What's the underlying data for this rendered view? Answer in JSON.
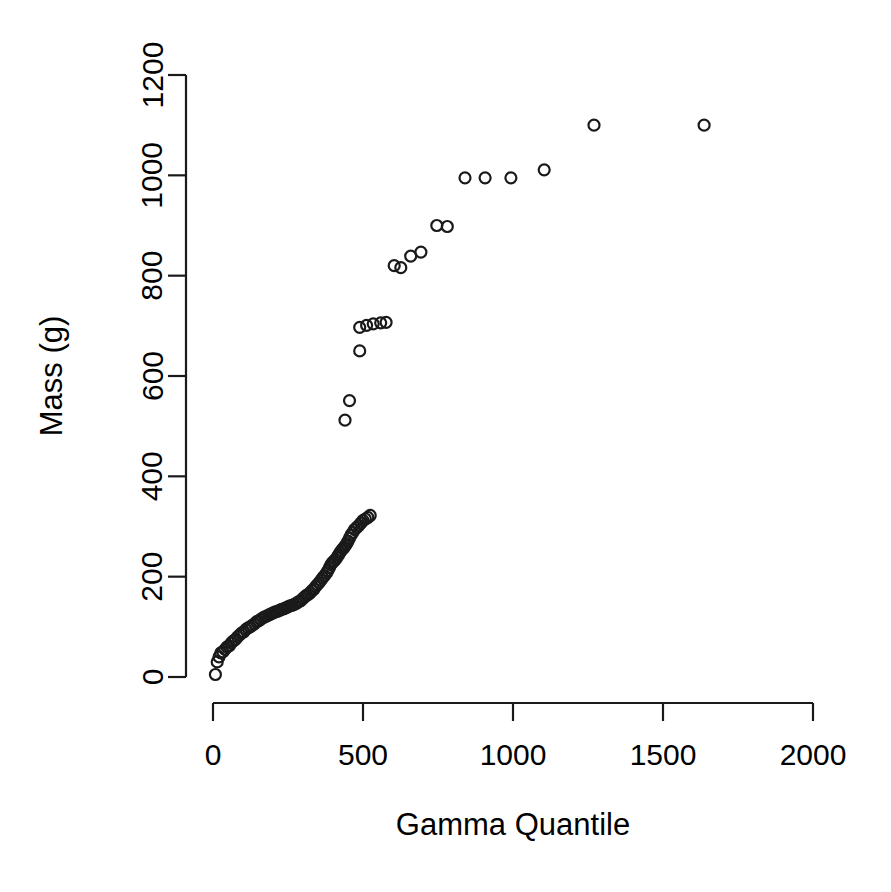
{
  "chart_data": {
    "type": "scatter",
    "title": "",
    "subtitle": "",
    "xlabel": "Gamma Quantile",
    "ylabel": "Mass (g)",
    "xlim": [
      0,
      2000
    ],
    "ylim": [
      0,
      1200
    ],
    "xticks": [
      0,
      500,
      1000,
      1500,
      2000
    ],
    "yticks": [
      0,
      200,
      400,
      600,
      800,
      1000,
      1200
    ],
    "xtick_labels": [
      "0",
      "500",
      "1000",
      "1500",
      "2000"
    ],
    "ytick_labels": [
      "0",
      "200",
      "400",
      "600",
      "800",
      "1000",
      "1200"
    ],
    "grid": false,
    "legend": null,
    "marker": "open-circle",
    "marker_size_px": 11,
    "point_color": "#1a1a1a",
    "background_color": "#ffffff",
    "n_points": 92,
    "points": [
      [
        8,
        5
      ],
      [
        14,
        30
      ],
      [
        20,
        40
      ],
      [
        26,
        48
      ],
      [
        33,
        50
      ],
      [
        40,
        55
      ],
      [
        47,
        60
      ],
      [
        54,
        62
      ],
      [
        61,
        68
      ],
      [
        68,
        72
      ],
      [
        75,
        75
      ],
      [
        82,
        80
      ],
      [
        89,
        84
      ],
      [
        96,
        88
      ],
      [
        103,
        90
      ],
      [
        110,
        95
      ],
      [
        117,
        98
      ],
      [
        124,
        100
      ],
      [
        131,
        103
      ],
      [
        138,
        106
      ],
      [
        145,
        110
      ],
      [
        152,
        112
      ],
      [
        159,
        115
      ],
      [
        166,
        118
      ],
      [
        173,
        120
      ],
      [
        180,
        122
      ],
      [
        187,
        124
      ],
      [
        194,
        126
      ],
      [
        201,
        128
      ],
      [
        208,
        130
      ],
      [
        215,
        131
      ],
      [
        222,
        133
      ],
      [
        229,
        135
      ],
      [
        236,
        136
      ],
      [
        243,
        138
      ],
      [
        250,
        140
      ],
      [
        257,
        142
      ],
      [
        264,
        143
      ],
      [
        271,
        145
      ],
      [
        278,
        147
      ],
      [
        285,
        150
      ],
      [
        292,
        152
      ],
      [
        299,
        156
      ],
      [
        306,
        160
      ],
      [
        312,
        163
      ],
      [
        318,
        165
      ],
      [
        324,
        168
      ],
      [
        330,
        172
      ],
      [
        336,
        175
      ],
      [
        342,
        180
      ],
      [
        348,
        184
      ],
      [
        354,
        188
      ],
      [
        360,
        193
      ],
      [
        366,
        198
      ],
      [
        372,
        202
      ],
      [
        378,
        207
      ],
      [
        383,
        212
      ],
      [
        388,
        218
      ],
      [
        393,
        224
      ],
      [
        398,
        228
      ],
      [
        403,
        231
      ],
      [
        408,
        234
      ],
      [
        413,
        238
      ],
      [
        418,
        243
      ],
      [
        423,
        248
      ],
      [
        428,
        252
      ],
      [
        433,
        256
      ],
      [
        437,
        258
      ],
      [
        441,
        262
      ],
      [
        446,
        266
      ],
      [
        450,
        271
      ],
      [
        455,
        277
      ],
      [
        460,
        283
      ],
      [
        466,
        288
      ],
      [
        472,
        294
      ],
      [
        479,
        298
      ],
      [
        486,
        302
      ],
      [
        493,
        307
      ],
      [
        500,
        312
      ],
      [
        508,
        315
      ],
      [
        516,
        318
      ],
      [
        524,
        322
      ],
      [
        440,
        512
      ],
      [
        455,
        551
      ],
      [
        489,
        650
      ],
      [
        489,
        697
      ],
      [
        512,
        701
      ],
      [
        534,
        704
      ],
      [
        559,
        706
      ],
      [
        577,
        707
      ],
      [
        604,
        820
      ],
      [
        626,
        816
      ],
      [
        659,
        839
      ],
      [
        693,
        847
      ],
      [
        746,
        900
      ],
      [
        781,
        898
      ],
      [
        840,
        995
      ],
      [
        907,
        995
      ],
      [
        993,
        995
      ],
      [
        1104,
        1011
      ],
      [
        1270,
        1100
      ],
      [
        1637,
        1100
      ]
    ]
  },
  "axes_geometry": {
    "plot_left_px": 213,
    "plot_right_px": 813,
    "plot_bottom_px": 677,
    "plot_top_px": 75
  }
}
